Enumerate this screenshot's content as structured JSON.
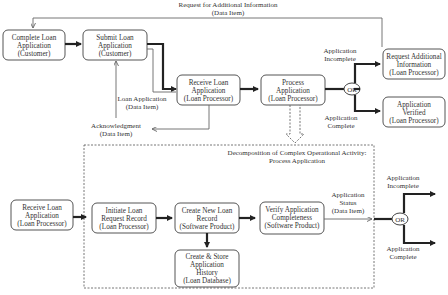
{
  "diagram": {
    "top_feedback_label": [
      "Request for Additional Information",
      "(Data Item)"
    ],
    "nodes": {
      "complete_loan_app": [
        "Complete Loan",
        "Application",
        "(Customer)"
      ],
      "submit_loan_app": [
        "Submit Loan",
        "Application",
        "(Customer)"
      ],
      "receive_loan_app_top": [
        "Receive Loan",
        "Application",
        "(Loan Processor)"
      ],
      "process_app": [
        "Process",
        "Application",
        "(Loan Processor)"
      ],
      "request_additional": [
        "Request Additional",
        "Information",
        "(Loan Processor)"
      ],
      "app_verified": [
        "Application",
        "Verified",
        "(Loan Processor)"
      ],
      "receive_loan_app_bottom": [
        "Receive Loan",
        "Application",
        "(Loan Processor)"
      ],
      "initiate_loan_request": [
        "Initiate Loan",
        "Request Record",
        "(Loan Processor)"
      ],
      "create_new_loan_record": [
        "Create New Loan",
        "Record",
        "(Software Product)"
      ],
      "verify_completeness": [
        "Verify Application",
        "Completeness",
        "(Software Product)"
      ],
      "create_store_history": [
        "Create & Store",
        "Application",
        "History",
        "(Loan Database)"
      ]
    },
    "labels": {
      "loan_application": [
        "Loan Application",
        "(Data Item)"
      ],
      "acknowledgment": [
        "Acknowledgment",
        "(Data Item)"
      ],
      "top_incomplete": [
        "Application",
        "Incomplete"
      ],
      "top_complete": [
        "Application",
        "Complete"
      ],
      "decomposition_title": [
        "Decomposition of Complex Operational Activity:",
        "Process Application"
      ],
      "app_status": [
        "Application",
        "Status",
        "(Data Item)"
      ],
      "bottom_incomplete": [
        "Application",
        "Incomplete"
      ],
      "bottom_complete": [
        "Application",
        "Complete"
      ]
    },
    "or_gate_label": "OR"
  }
}
